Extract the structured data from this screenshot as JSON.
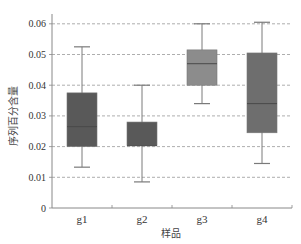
{
  "chart_data": {
    "type": "boxplot",
    "title": "",
    "xlabel": "样品",
    "ylabel": "序列百分含量",
    "categories": [
      "g1",
      "g2",
      "g3",
      "g4"
    ],
    "yticks": [
      "0",
      "0.01",
      "0.02",
      "0.03",
      "0.04",
      "0.05",
      "0.06"
    ],
    "ylim": [
      0,
      0.064
    ],
    "grid": "horizontal dashed",
    "legend": "none",
    "series": [
      {
        "name": "g1",
        "whisker_low": 0.0133,
        "q1": 0.02,
        "median": 0.0265,
        "q3": 0.0375,
        "whisker_high": 0.0525,
        "color": "#595959"
      },
      {
        "name": "g2",
        "whisker_low": 0.0085,
        "q1": 0.0203,
        "median": 0.0203,
        "q3": 0.028,
        "whisker_high": 0.04,
        "color": "#595959"
      },
      {
        "name": "g3",
        "whisker_low": 0.034,
        "q1": 0.04,
        "median": 0.047,
        "q3": 0.0515,
        "whisker_high": 0.06,
        "color": "#8c8c8c"
      },
      {
        "name": "g4",
        "whisker_low": 0.0145,
        "q1": 0.0245,
        "median": 0.034,
        "q3": 0.0505,
        "whisker_high": 0.0605,
        "color": "#6e6e6e"
      }
    ]
  },
  "colors": {
    "axis": "#888888",
    "grid": "#999999",
    "whisker": "#7a7a7a"
  }
}
